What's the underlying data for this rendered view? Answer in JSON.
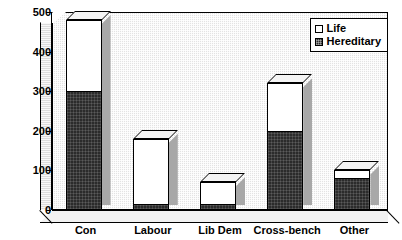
{
  "chart_data": {
    "type": "bar",
    "title": "",
    "xlabel": "",
    "ylabel": "",
    "stacked": true,
    "grid": false,
    "ylim": [
      0,
      500
    ],
    "ytick_step": 100,
    "yticks": [
      "0",
      "100",
      "200",
      "300",
      "400",
      "500"
    ],
    "categories": [
      "Con",
      "Labour",
      "Lib Dem",
      "Cross-bench",
      "Other"
    ],
    "legend_position": "top-right",
    "series": [
      {
        "name": "Hereditary",
        "color": "#2b2b2b",
        "values": [
          300,
          15,
          15,
          200,
          80
        ]
      },
      {
        "name": "Life",
        "color": "#ffffff",
        "values": [
          180,
          165,
          55,
          120,
          20
        ]
      }
    ],
    "totals": [
      480,
      180,
      70,
      320,
      100
    ]
  },
  "legend": {
    "items": [
      {
        "label": "Life",
        "swatch": "white-square-icon"
      },
      {
        "label": "Hereditary",
        "swatch": "dark-square-icon"
      }
    ]
  }
}
